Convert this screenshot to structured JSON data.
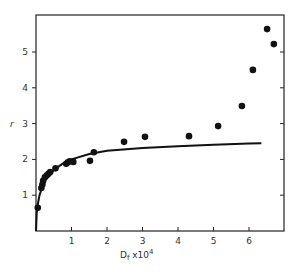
{
  "chart_data": {
    "type": "scatter",
    "title": "",
    "xlabel": "D_f x10^4",
    "xlabel_main": "D",
    "xlabel_sub": "f",
    "xlabel_rest": " x10",
    "xlabel_sup": "4",
    "ylabel": "r",
    "xlim": [
      0,
      7
    ],
    "ylim": [
      0,
      6
    ],
    "xticks": [
      1,
      2,
      3,
      4,
      5,
      6
    ],
    "yticks": [
      1,
      2,
      3,
      4,
      5
    ],
    "grid": false,
    "legend": null,
    "series": [
      {
        "name": "measured",
        "kind": "scatter",
        "points": [
          [
            0.05,
            0.65
          ],
          [
            0.15,
            1.2
          ],
          [
            0.18,
            1.3
          ],
          [
            0.2,
            1.4
          ],
          [
            0.25,
            1.5
          ],
          [
            0.3,
            1.55
          ],
          [
            0.35,
            1.6
          ],
          [
            0.4,
            1.65
          ],
          [
            0.55,
            1.75
          ],
          [
            0.85,
            1.88
          ],
          [
            0.9,
            1.92
          ],
          [
            0.95,
            1.95
          ],
          [
            1.05,
            1.93
          ],
          [
            1.52,
            1.96
          ],
          [
            1.63,
            2.2
          ],
          [
            2.48,
            2.49
          ],
          [
            3.07,
            2.63
          ],
          [
            4.31,
            2.65
          ],
          [
            5.13,
            2.93
          ],
          [
            5.8,
            3.49
          ],
          [
            6.11,
            4.5
          ],
          [
            6.51,
            5.64
          ],
          [
            6.7,
            5.22
          ]
        ]
      },
      {
        "name": "model curve",
        "kind": "line",
        "points": [
          [
            0.0,
            0.0
          ],
          [
            0.02,
            0.5
          ],
          [
            0.05,
            0.75
          ],
          [
            0.1,
            1.0
          ],
          [
            0.2,
            1.3
          ],
          [
            0.3,
            1.48
          ],
          [
            0.5,
            1.7
          ],
          [
            0.75,
            1.88
          ],
          [
            1.0,
            2.0
          ],
          [
            1.5,
            2.15
          ],
          [
            2.0,
            2.24
          ],
          [
            3.0,
            2.32
          ],
          [
            4.0,
            2.37
          ],
          [
            5.0,
            2.41
          ],
          [
            6.0,
            2.44
          ],
          [
            6.35,
            2.45
          ]
        ]
      }
    ]
  }
}
